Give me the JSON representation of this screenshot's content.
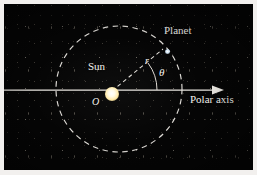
{
  "figure": {
    "type": "polar-coordinate-orbit-diagram",
    "caption": "",
    "background_color": "#050505",
    "border_color": "#f2f0ee",
    "stroke_color": "#f4f2ee",
    "sun_color": "#f5c24a",
    "planet_color": "#ffffff"
  },
  "labels": {
    "planet": "Planet",
    "sun": "Sun",
    "polar_axis": "Polar axis",
    "radius": "r",
    "angle": "θ",
    "origin": "O"
  },
  "geometry": {
    "orbit_center": {
      "x": 119,
      "y": 88
    },
    "orbit_radius": 63,
    "orbit_style": "dashed",
    "sun_position": {
      "x": 108,
      "y": 90
    },
    "sun_radius": 13,
    "planet_position": {
      "x": 164,
      "y": 48
    },
    "polar_axis_start": {
      "x": 0,
      "y": 90
    },
    "polar_axis_end": {
      "x": 215,
      "y": 90
    },
    "polar_axis_arrowhead": true,
    "radius_line_style": "dashed",
    "angle_arc_radius": 46,
    "angle_degrees": 37
  }
}
